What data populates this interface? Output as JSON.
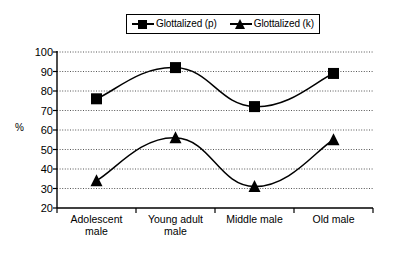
{
  "chart_data": {
    "type": "line",
    "title": "",
    "xlabel": "",
    "ylabel": "%",
    "categories": [
      "Adolescent\nmale",
      "Young adult\nmale",
      "Middle male",
      "Old male"
    ],
    "ylim": [
      20,
      100
    ],
    "ytick_labels": [
      "100",
      "90",
      "80",
      "70",
      "60",
      "50",
      "40",
      "30",
      "20"
    ],
    "yticks": [
      100,
      90,
      80,
      70,
      60,
      50,
      40,
      30,
      20
    ],
    "grid": true,
    "grid_style": "dotted-horizontal",
    "legend_position": "top-center",
    "smoothed": true,
    "series": [
      {
        "name": "Glottalized (p)",
        "marker": "square",
        "color": "#000000",
        "values": [
          76,
          92,
          72,
          89
        ]
      },
      {
        "name": "Glottalized (k)",
        "marker": "triangle",
        "color": "#000000",
        "values": [
          34,
          56,
          31,
          55
        ]
      }
    ]
  },
  "legend": {
    "entries": [
      {
        "label": "Glottalized (p)",
        "marker": "square-marker-icon"
      },
      {
        "label": "Glottalized (k)",
        "marker": "triangle-marker-icon"
      }
    ]
  },
  "axis": {
    "y_title": "%"
  },
  "colors": {
    "line": "#000000",
    "grid": "#555555",
    "axis": "#000000",
    "background": "#ffffff"
  }
}
